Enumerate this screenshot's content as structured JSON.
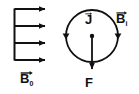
{
  "figure": {
    "background_color": "#ffffff",
    "stroke_color": "#111111",
    "width": 139,
    "height": 94
  },
  "labels": {
    "b0": {
      "base": "B",
      "subscript": "0",
      "vector": true,
      "meaning": "uniform-external-magnetic-field"
    },
    "bi": {
      "base": "B",
      "subscript": "i",
      "vector": true,
      "meaning": "induced-magnetic-field"
    },
    "j": {
      "base": "J",
      "subscript": "",
      "vector": true,
      "meaning": "current-density"
    },
    "f": {
      "base": "F",
      "subscript": "",
      "vector": false,
      "meaning": "force"
    }
  },
  "field_arrows": {
    "name": "uniform-field-arrows",
    "count": 4,
    "direction": "right",
    "bar_x": 14,
    "tip_x": 48,
    "ys": [
      9,
      26,
      43,
      60
    ]
  },
  "loop": {
    "name": "current-loop",
    "center_x": 92,
    "center_y": 36,
    "radius": 26,
    "arrowheads": [
      {
        "side": "left",
        "x": 66,
        "y": 36,
        "points": "down"
      },
      {
        "side": "right",
        "x": 118,
        "y": 36,
        "points": "down"
      }
    ]
  },
  "force_arrow": {
    "name": "force-arrow",
    "from_x": 92,
    "from_y": 36,
    "to_x": 92,
    "to_y": 72,
    "direction": "down",
    "has_origin_dot": true
  }
}
